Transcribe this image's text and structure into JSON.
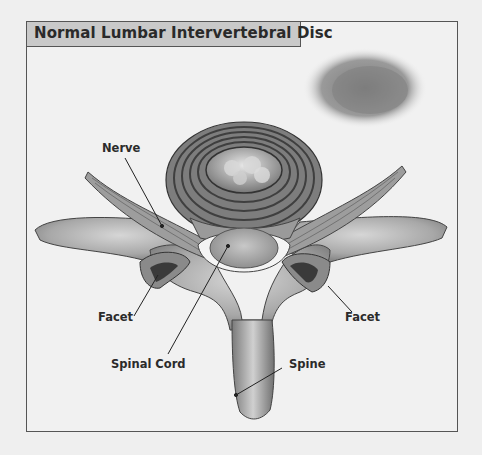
{
  "title": "Normal Lumbar Intervertebral Disc",
  "labels": {
    "nerve": "Nerve",
    "facet_left": "Facet",
    "facet_right": "Facet",
    "spinal_cord": "Spinal Cord",
    "spine": "Spine"
  },
  "colors": {
    "background": "#efefef",
    "title_bar": "#c9c9c9",
    "frame": "#555555",
    "bone": "#9a9a9a",
    "disc_rings": "#5a5a5a"
  }
}
